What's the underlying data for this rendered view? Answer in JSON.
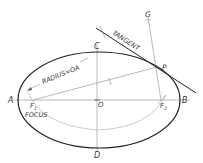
{
  "diagram": {
    "colors": {
      "ink": "#222222",
      "thin": "#8a8a8a",
      "light": "#b5b5b5",
      "background": "#ffffff"
    },
    "points": {
      "A": {
        "label": "A",
        "x": 10,
        "y": 103
      },
      "B": {
        "label": "B",
        "x": 184,
        "y": 103
      },
      "C": {
        "label": "C",
        "x": 95,
        "y": 49
      },
      "D": {
        "label": "D",
        "x": 95,
        "y": 158
      },
      "O": {
        "label": "O",
        "x": 98,
        "y": 106
      },
      "P": {
        "label": "P",
        "x": 159,
        "y": 70
      },
      "G": {
        "label": "G",
        "x": 145,
        "y": 19
      },
      "F1": {
        "label": "F",
        "sub": "1",
        "x": 30,
        "y": 110
      },
      "F2": {
        "label": "F",
        "sub": "2",
        "x": 162,
        "y": 110
      }
    },
    "annotations": {
      "tangent": "TANGENT",
      "radius": "RADIUS=OA",
      "focus": "FOCUS"
    },
    "ellipse": {
      "cx": 99,
      "cy": 100,
      "rx": 81,
      "ry": 48
    }
  }
}
